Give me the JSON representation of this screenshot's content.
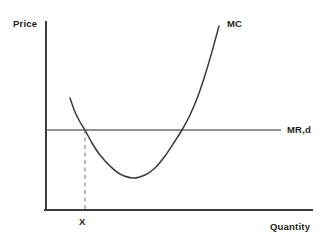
{
  "figure": {
    "title": "",
    "background_color": "#ffffff",
    "width": 328,
    "height": 244
  },
  "axes": {
    "y_axis_label": "Price",
    "x_axis_label": "Quantity",
    "axis_color": "#3a3a3a",
    "origin_x": 46,
    "origin_y": 210,
    "y_axis_top": 22,
    "x_axis_right": 312
  },
  "labels": {
    "mc_curve": "MC",
    "mr_d_line": "MR,d",
    "x_tick": "X"
  },
  "colors": {
    "curve": "#3a3a3a",
    "mr_line": "#6e6e6e",
    "dashed_guide": "#a8a8a8",
    "text": "#231f20"
  },
  "chart_data": {
    "type": "line",
    "title": "",
    "xlabel": "Quantity",
    "ylabel": "Price",
    "grid": false,
    "legend": "inline-labels",
    "axis_ticks": {
      "x": [
        "X"
      ],
      "y": []
    },
    "annotations": [
      {
        "text": "MC",
        "describes": "marginal cost curve, U-shaped",
        "x": 228,
        "y": 24
      },
      {
        "text": "MR,d",
        "describes": "marginal revenue equals demand, horizontal price line",
        "x": 288,
        "y": 130
      },
      {
        "text": "X",
        "describes": "quantity where MC crosses MR,d on the downward segment",
        "x": 82,
        "y": 222
      }
    ],
    "series": [
      {
        "name": "MC",
        "kind": "curve",
        "style": "solid",
        "color": "#3a3a3a",
        "description": "U-shaped marginal cost curve falling from upper left, reaching a minimum, then rising steeply",
        "points": [
          [
            70,
            98
          ],
          [
            75,
            112
          ],
          [
            80,
            122
          ],
          [
            85,
            130
          ],
          [
            92,
            143
          ],
          [
            100,
            155
          ],
          [
            110,
            166
          ],
          [
            120,
            174
          ],
          [
            133,
            178
          ],
          [
            145,
            175
          ],
          [
            155,
            168
          ],
          [
            165,
            156
          ],
          [
            175,
            141
          ],
          [
            182,
            130
          ],
          [
            190,
            115
          ],
          [
            198,
            96
          ],
          [
            206,
            72
          ],
          [
            213,
            48
          ],
          [
            219,
            26
          ]
        ],
        "minimum_point": [
          133,
          178
        ]
      },
      {
        "name": "MR,d",
        "kind": "horizontal-line",
        "style": "solid",
        "color": "#6e6e6e",
        "description": "horizontal marginal revenue / demand line at constant price",
        "points": [
          [
            46,
            130
          ],
          [
            281,
            130
          ]
        ]
      },
      {
        "name": "X guide",
        "kind": "vertical-line",
        "style": "dashed",
        "color": "#a8a8a8",
        "description": "dashed vertical dropline from first MC/MRd intersection down to the quantity axis",
        "points": [
          [
            85,
            130
          ],
          [
            85,
            210
          ]
        ]
      }
    ],
    "intersections": [
      {
        "label": "first MC x MR,d",
        "x": 85,
        "y": 130
      },
      {
        "label": "second MC x MR,d",
        "x": 182,
        "y": 130
      }
    ]
  }
}
